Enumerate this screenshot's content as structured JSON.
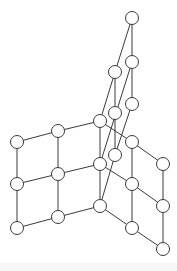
{
  "diagram": {
    "type": "lattice-graph",
    "node_radius": 6.5,
    "nodes": [
      {
        "id": "a",
        "x": 132,
        "y": 18
      },
      {
        "id": "b",
        "x": 132,
        "y": 62
      },
      {
        "id": "c",
        "x": 115,
        "y": 72
      },
      {
        "id": "d",
        "x": 132,
        "y": 104
      },
      {
        "id": "e",
        "x": 115,
        "y": 113
      },
      {
        "id": "f",
        "x": 115,
        "y": 155
      },
      {
        "id": "g",
        "x": 100,
        "y": 121
      },
      {
        "id": "h",
        "x": 100,
        "y": 164
      },
      {
        "id": "i",
        "x": 100,
        "y": 206
      },
      {
        "id": "l1",
        "x": 17,
        "y": 142
      },
      {
        "id": "l2",
        "x": 58,
        "y": 131
      },
      {
        "id": "l3",
        "x": 17,
        "y": 184
      },
      {
        "id": "l4",
        "x": 58,
        "y": 174
      },
      {
        "id": "l5",
        "x": 17,
        "y": 228
      },
      {
        "id": "l6",
        "x": 58,
        "y": 217
      },
      {
        "id": "r1",
        "x": 132,
        "y": 142
      },
      {
        "id": "r2",
        "x": 163,
        "y": 164
      },
      {
        "id": "r3",
        "x": 132,
        "y": 184
      },
      {
        "id": "r4",
        "x": 163,
        "y": 206
      },
      {
        "id": "r5",
        "x": 132,
        "y": 228
      },
      {
        "id": "r6",
        "x": 163,
        "y": 249
      }
    ],
    "edges": [
      [
        "a",
        "b"
      ],
      [
        "a",
        "c"
      ],
      [
        "b",
        "d"
      ],
      [
        "b",
        "h"
      ],
      [
        "c",
        "e"
      ],
      [
        "c",
        "g"
      ],
      [
        "d",
        "f"
      ],
      [
        "e",
        "f"
      ],
      [
        "f",
        "i"
      ],
      [
        "g",
        "h"
      ],
      [
        "h",
        "i"
      ],
      [
        "l1",
        "l2"
      ],
      [
        "l2",
        "g"
      ],
      [
        "l3",
        "l4"
      ],
      [
        "l4",
        "h"
      ],
      [
        "l5",
        "l6"
      ],
      [
        "l6",
        "i"
      ],
      [
        "l1",
        "l3"
      ],
      [
        "l3",
        "l5"
      ],
      [
        "l2",
        "l4"
      ],
      [
        "l4",
        "l6"
      ],
      [
        "g",
        "r1"
      ],
      [
        "r1",
        "r2"
      ],
      [
        "h",
        "r3"
      ],
      [
        "r3",
        "r4"
      ],
      [
        "i",
        "r5"
      ],
      [
        "r5",
        "r6"
      ],
      [
        "r1",
        "r3"
      ],
      [
        "r3",
        "r5"
      ],
      [
        "r2",
        "r4"
      ],
      [
        "r4",
        "r6"
      ]
    ]
  }
}
